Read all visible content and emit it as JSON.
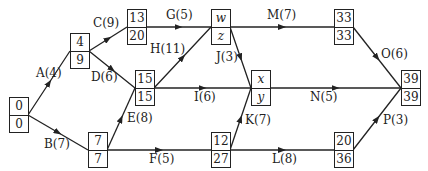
{
  "diagram": {
    "type": "activity-on-arrow network",
    "nodes": [
      {
        "id": "n0",
        "top": "0",
        "bottom": "0",
        "x": 9,
        "y": 97,
        "italic": false
      },
      {
        "id": "n1",
        "top": "4",
        "bottom": "9",
        "x": 70,
        "y": 33,
        "italic": false
      },
      {
        "id": "n2",
        "top": "7",
        "bottom": "7",
        "x": 88,
        "y": 132,
        "italic": false
      },
      {
        "id": "n3",
        "top": "13",
        "bottom": "20",
        "x": 127,
        "y": 9,
        "italic": false
      },
      {
        "id": "n4",
        "top": "15",
        "bottom": "15",
        "x": 135,
        "y": 70,
        "italic": false
      },
      {
        "id": "n5",
        "top": "w",
        "bottom": "z",
        "x": 211,
        "y": 9,
        "italic": true
      },
      {
        "id": "n6",
        "top": "x",
        "bottom": "y",
        "x": 251,
        "y": 70,
        "italic": true
      },
      {
        "id": "n7",
        "top": "12",
        "bottom": "27",
        "x": 211,
        "y": 132,
        "italic": false
      },
      {
        "id": "n8",
        "top": "33",
        "bottom": "33",
        "x": 334,
        "y": 9,
        "italic": false
      },
      {
        "id": "n9",
        "top": "20",
        "bottom": "36",
        "x": 334,
        "y": 132,
        "italic": false
      },
      {
        "id": "n10",
        "top": "39",
        "bottom": "39",
        "x": 401,
        "y": 70,
        "italic": false
      }
    ],
    "edges": [
      {
        "label": "A(4)",
        "from": [
          28,
          115
        ],
        "to": [
          70,
          51
        ],
        "lx": 36,
        "ly": 66
      },
      {
        "label": "B(7)",
        "from": [
          28,
          115
        ],
        "to": [
          88,
          150
        ],
        "lx": 44,
        "ly": 137
      },
      {
        "label": "C(9)",
        "from": [
          89,
          51
        ],
        "to": [
          127,
          27
        ],
        "lx": 93,
        "ly": 16
      },
      {
        "label": "D(6)",
        "from": [
          89,
          51
        ],
        "to": [
          135,
          88
        ],
        "lx": 91,
        "ly": 70
      },
      {
        "label": "E(8)",
        "from": [
          107,
          150
        ],
        "to": [
          135,
          88
        ],
        "lx": 127,
        "ly": 111
      },
      {
        "label": "F(5)",
        "from": [
          107,
          150
        ],
        "to": [
          211,
          150
        ],
        "lx": 149,
        "ly": 152
      },
      {
        "label": "G(5)",
        "from": [
          146,
          27
        ],
        "to": [
          211,
          27
        ],
        "lx": 166,
        "ly": 8
      },
      {
        "label": "H(11)",
        "from": [
          154,
          88
        ],
        "to": [
          211,
          27
        ],
        "lx": 150,
        "ly": 42
      },
      {
        "label": "I(6)",
        "from": [
          154,
          88
        ],
        "to": [
          251,
          88
        ],
        "lx": 194,
        "ly": 90
      },
      {
        "label": "J(3)",
        "from": [
          230,
          27
        ],
        "to": [
          251,
          88
        ],
        "lx": 216,
        "ly": 50
      },
      {
        "label": "K(7)",
        "from": [
          230,
          150
        ],
        "to": [
          251,
          88
        ],
        "lx": 245,
        "ly": 113
      },
      {
        "label": "L(8)",
        "from": [
          230,
          150
        ],
        "to": [
          334,
          150
        ],
        "lx": 272,
        "ly": 152
      },
      {
        "label": "M(7)",
        "from": [
          230,
          27
        ],
        "to": [
          334,
          27
        ],
        "lx": 267,
        "ly": 8
      },
      {
        "label": "N(5)",
        "from": [
          270,
          88
        ],
        "to": [
          401,
          88
        ],
        "lx": 310,
        "ly": 90
      },
      {
        "label": "O(6)",
        "from": [
          353,
          27
        ],
        "to": [
          401,
          88
        ],
        "lx": 381,
        "ly": 47
      },
      {
        "label": "P(3)",
        "from": [
          353,
          150
        ],
        "to": [
          401,
          88
        ],
        "lx": 383,
        "ly": 113
      }
    ],
    "colors": {
      "line": "#222222",
      "background": "#ffffff"
    }
  }
}
